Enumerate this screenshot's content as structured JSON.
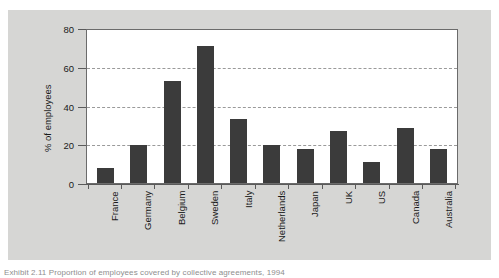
{
  "chart_data": {
    "type": "bar",
    "title": "",
    "xlabel": "",
    "ylabel": "% of employees",
    "ylim": [
      0,
      80
    ],
    "yticks": [
      0,
      20,
      40,
      60,
      80
    ],
    "grid": "horizontal-dashed",
    "legend": "none",
    "bar_color": "#3b3b3b",
    "categories": [
      "France",
      "Germany",
      "Belgium",
      "Sweden",
      "Italy",
      "Netherlands",
      "Japan",
      "UK",
      "US",
      "Canada",
      "Australia"
    ],
    "values": [
      8,
      19.5,
      52.5,
      70.5,
      33,
      19.5,
      17.5,
      27,
      11,
      28.5,
      17.5
    ]
  },
  "figure": {
    "panel_background": "#d6d6d4",
    "plot_background": "#ffffff",
    "axis_color": "#5a5a5a",
    "gridline_color": "#9a9a9a",
    "caption_partial": "Exhibit 2.11  Proportion of employees covered by collective agreements, 1994"
  }
}
